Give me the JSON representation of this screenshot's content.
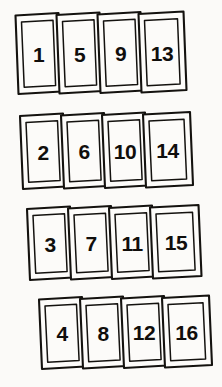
{
  "diagram": {
    "background_color": "#fbfaf8",
    "ink_color": "#14120f",
    "card_fill_color": "#fdfcfa",
    "rows": [
      {
        "row_label": "row-1",
        "cards": [
          {
            "label": "1"
          },
          {
            "label": "5"
          },
          {
            "label": "9"
          },
          {
            "label": "13"
          }
        ]
      },
      {
        "row_label": "row-2",
        "cards": [
          {
            "label": "2"
          },
          {
            "label": "6"
          },
          {
            "label": "10"
          },
          {
            "label": "14"
          }
        ]
      },
      {
        "row_label": "row-3",
        "cards": [
          {
            "label": "3"
          },
          {
            "label": "7"
          },
          {
            "label": "11"
          },
          {
            "label": "15"
          }
        ]
      },
      {
        "row_label": "row-4",
        "cards": [
          {
            "label": "4"
          },
          {
            "label": "8"
          },
          {
            "label": "12"
          },
          {
            "label": "16"
          }
        ]
      }
    ]
  }
}
